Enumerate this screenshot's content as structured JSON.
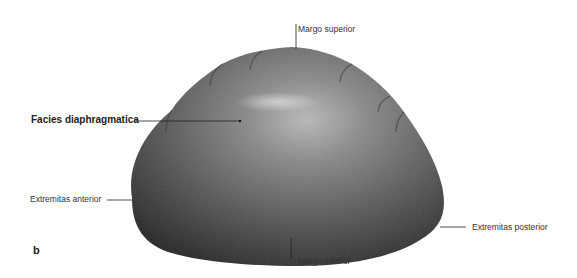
{
  "figure": {
    "panel_letter": "b",
    "colors": {
      "background": "#ffffff",
      "organ_dark": "#2e2e2e",
      "organ_mid": "#6a6a6a",
      "organ_highlight": "#b9b9b9",
      "leader_line": "#222222",
      "label_text": "#333333"
    },
    "labels": [
      {
        "id": "margo-superior",
        "text": "Margo superior",
        "bold": false
      },
      {
        "id": "facies-diaphragmatica",
        "text": "Facies diaphragmatica",
        "bold": true
      },
      {
        "id": "extremitas-anterior",
        "text": "Extremitas anterior",
        "bold": false
      },
      {
        "id": "extremitas-posterior",
        "text": "Extremitas posterior",
        "bold": false
      },
      {
        "id": "margo-inferior",
        "text": "Margo inferior",
        "bold": false
      }
    ]
  }
}
